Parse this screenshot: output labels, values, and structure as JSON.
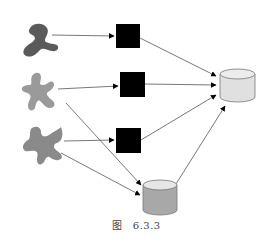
{
  "figure": {
    "caption_prefix": "图",
    "caption_number": "6.3.3"
  },
  "colors": {
    "blob_dark": "#5a5a5a",
    "blob_light": "#9a9a9a",
    "blob_mid": "#8a8a8a",
    "square": "#000000",
    "cylinder_top_fill": "#e4e4e4",
    "cylinder_bottom_fill": "#a8a8a8",
    "edge": "#555555"
  },
  "nodes": [
    {
      "id": "blob-1",
      "kind": "blob"
    },
    {
      "id": "blob-2",
      "kind": "blob"
    },
    {
      "id": "blob-3",
      "kind": "blob"
    },
    {
      "id": "square-1",
      "kind": "square"
    },
    {
      "id": "square-2",
      "kind": "square"
    },
    {
      "id": "square-3",
      "kind": "square"
    },
    {
      "id": "cylinder-gray",
      "kind": "cylinder"
    },
    {
      "id": "cylinder-light",
      "kind": "cylinder"
    }
  ],
  "edges": [
    {
      "from": "blob-1",
      "to": "square-1"
    },
    {
      "from": "blob-2",
      "to": "square-2"
    },
    {
      "from": "blob-2",
      "to": "cylinder-gray"
    },
    {
      "from": "blob-3",
      "to": "square-3"
    },
    {
      "from": "blob-3",
      "to": "cylinder-gray"
    },
    {
      "from": "square-1",
      "to": "cylinder-light"
    },
    {
      "from": "square-2",
      "to": "cylinder-light"
    },
    {
      "from": "square-3",
      "to": "cylinder-light"
    },
    {
      "from": "cylinder-gray",
      "to": "cylinder-light"
    }
  ]
}
